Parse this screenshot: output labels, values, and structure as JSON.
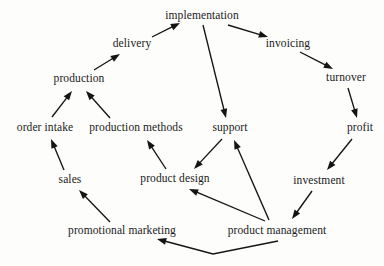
{
  "diagram": {
    "title": "",
    "type": "directed-graph",
    "background_color": "#fdfdfc",
    "text_color": "#1a1a1a",
    "edge_color": "#141414",
    "nodes": [
      {
        "id": "implementation",
        "label": "implementation",
        "x": 202,
        "y": 16
      },
      {
        "id": "delivery",
        "label": "delivery",
        "x": 132,
        "y": 44
      },
      {
        "id": "invoicing",
        "label": "invoicing",
        "x": 288,
        "y": 44
      },
      {
        "id": "production",
        "label": "production",
        "x": 79,
        "y": 79
      },
      {
        "id": "turnover",
        "label": "turnover",
        "x": 346,
        "y": 78
      },
      {
        "id": "order-intake",
        "label": "order intake",
        "x": 45,
        "y": 128
      },
      {
        "id": "production-methods",
        "label": "production methods",
        "x": 136,
        "y": 128
      },
      {
        "id": "support",
        "label": "support",
        "x": 230,
        "y": 128
      },
      {
        "id": "profit",
        "label": "profit",
        "x": 360,
        "y": 128
      },
      {
        "id": "sales",
        "label": "sales",
        "x": 70,
        "y": 180
      },
      {
        "id": "product-design",
        "label": "product design",
        "x": 175,
        "y": 179
      },
      {
        "id": "investment",
        "label": "investment",
        "x": 319,
        "y": 181
      },
      {
        "id": "promotional-marketing",
        "label": "promotional marketing",
        "x": 122,
        "y": 231
      },
      {
        "id": "product-management",
        "label": "product management",
        "x": 277,
        "y": 231
      }
    ],
    "edges": [
      {
        "id": "edge-order-intake-production",
        "from": "order intake",
        "to": "production",
        "directed": true
      },
      {
        "id": "edge-production-methods-production",
        "from": "production methods",
        "to": "production",
        "directed": true
      },
      {
        "id": "edge-production-delivery",
        "from": "production",
        "to": "delivery",
        "directed": true
      },
      {
        "id": "edge-delivery-implementation",
        "from": "delivery",
        "to": "implementation",
        "directed": true
      },
      {
        "id": "edge-implementation-invoicing",
        "from": "implementation",
        "to": "invoicing",
        "directed": true
      },
      {
        "id": "edge-implementation-support",
        "from": "implementation",
        "to": "support",
        "directed": true
      },
      {
        "id": "edge-invoicing-turnover",
        "from": "invoicing",
        "to": "turnover",
        "directed": true
      },
      {
        "id": "edge-turnover-profit",
        "from": "turnover",
        "to": "profit",
        "directed": true
      },
      {
        "id": "edge-profit-investment",
        "from": "profit",
        "to": "investment",
        "directed": true
      },
      {
        "id": "edge-investment-product-management",
        "from": "investment",
        "to": "product management",
        "directed": true
      },
      {
        "id": "edge-product-management-promotional-marketing",
        "from": "product management",
        "to": "promotional marketing",
        "directed": true
      },
      {
        "id": "edge-product-management-product-design",
        "from": "product management",
        "to": "product design",
        "directed": true
      },
      {
        "id": "edge-product-management-support",
        "from": "product management",
        "to": "support",
        "directed": true
      },
      {
        "id": "edge-support-product-design",
        "from": "support",
        "to": "product design",
        "directed": true
      },
      {
        "id": "edge-product-design-production-methods",
        "from": "product design",
        "to": "production methods",
        "directed": true
      },
      {
        "id": "edge-promotional-marketing-sales",
        "from": "promotional marketing",
        "to": "sales",
        "directed": true
      },
      {
        "id": "edge-sales-order-intake",
        "from": "sales",
        "to": "order intake",
        "directed": true
      }
    ],
    "edge_geometry": {
      "edge-order-intake-production": [
        [
          52,
          117
        ],
        [
          72,
          91
        ]
      ],
      "edge-production-methods-production": [
        [
          110,
          118
        ],
        [
          86,
          91
        ]
      ],
      "edge-production-delivery": [
        [
          94,
          70
        ],
        [
          120,
          54
        ]
      ],
      "edge-delivery-implementation": [
        [
          152,
          37
        ],
        [
          180,
          23
        ]
      ],
      "edge-implementation-invoicing": [
        [
          228,
          25
        ],
        [
          268,
          37
        ]
      ],
      "edge-implementation-support": [
        [
          203,
          25
        ],
        [
          226,
          118
        ]
      ],
      "edge-invoicing-turnover": [
        [
          300,
          52
        ],
        [
          333,
          69
        ]
      ],
      "edge-turnover-profit": [
        [
          348,
          88
        ],
        [
          357,
          118
        ]
      ],
      "edge-profit-investment": [
        [
          352,
          139
        ],
        [
          327,
          170
        ]
      ],
      "edge-investment-product-management": [
        [
          312,
          191
        ],
        [
          292,
          219
        ]
      ],
      "edge-product-management-promotional-marketing": [
        [
          278,
          241
        ],
        [
          213,
          254
        ],
        [
          157,
          239
        ]
      ],
      "edge-product-management-product-design": [
        [
          265,
          221
        ],
        [
          189,
          189
        ]
      ],
      "edge-product-management-support": [
        [
          269,
          220
        ],
        [
          234,
          140
        ]
      ],
      "edge-support-product-design": [
        [
          222,
          139
        ],
        [
          194,
          169
        ]
      ],
      "edge-product-design-production-methods": [
        [
          166,
          169
        ],
        [
          147,
          140
        ]
      ],
      "edge-promotional-marketing-sales": [
        [
          110,
          222
        ],
        [
          79,
          190
        ]
      ],
      "edge-sales-order-intake": [
        [
          64,
          170
        ],
        [
          51,
          139
        ]
      ]
    }
  }
}
